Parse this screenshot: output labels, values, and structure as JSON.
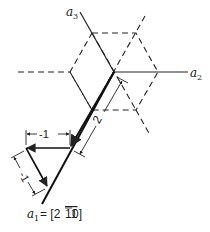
{
  "diagram": {
    "type": "hexagonal-lattice-vector-decomposition",
    "axes": {
      "a1": {
        "label": "a",
        "subscript": "1",
        "equation": "= [2",
        "bar_digits": "11",
        "tail": "0]"
      },
      "a2": {
        "label": "a",
        "subscript": "2"
      },
      "a3": {
        "label": "a",
        "subscript": "3"
      }
    },
    "dimensions": {
      "horizontal": "-1",
      "diagonal": "-1",
      "along_a1": "2"
    },
    "colors": {
      "line": "#222222",
      "background": "#ffffff"
    }
  }
}
